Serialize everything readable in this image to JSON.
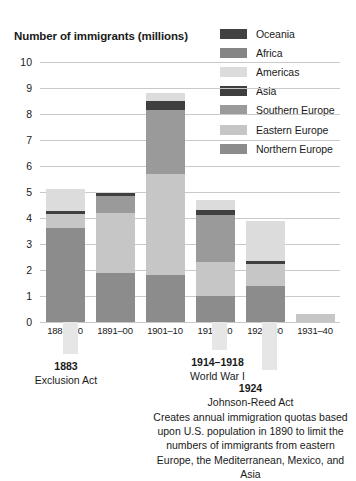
{
  "chart_data": {
    "type": "bar",
    "title": "Number of immigrants (millions)",
    "xlabel": "",
    "ylabel": "Number of immigrants (millions)",
    "ylim": [
      0,
      10
    ],
    "yticks": [
      0,
      1,
      2,
      3,
      4,
      5,
      6,
      7,
      8,
      9,
      10
    ],
    "grid": true,
    "stacked": true,
    "legend_position": "top-right",
    "categories": [
      "1881–90",
      "1891–00",
      "1901–10",
      "1911–20",
      "1921–30",
      "1931–40"
    ],
    "series": [
      {
        "name": "Northern Europe",
        "color": "#8c8c8c",
        "values": [
          3.6,
          1.9,
          1.8,
          1.0,
          1.4,
          0.0
        ]
      },
      {
        "name": "Eastern Europe",
        "color": "#c6c6c6",
        "values": [
          0.55,
          2.3,
          3.9,
          1.3,
          0.85,
          0.3
        ]
      },
      {
        "name": "Southern Europe",
        "color": "#9a9a9a",
        "values": [
          0.0,
          0.65,
          2.45,
          1.8,
          0.0,
          0.0
        ]
      },
      {
        "name": "Asia",
        "color": "#3f3f3f",
        "values": [
          0.12,
          0.1,
          0.35,
          0.2,
          0.1,
          0.0
        ]
      },
      {
        "name": "Americas",
        "color": "#dcdcdc",
        "values": [
          0.83,
          0.05,
          0.3,
          0.4,
          1.55,
          0.0
        ]
      },
      {
        "name": "Africa",
        "color": "#858585",
        "values": [
          0.0,
          0.0,
          0.0,
          0.0,
          0.0,
          0.0
        ]
      },
      {
        "name": "Oceania",
        "color": "#414141",
        "values": [
          0.0,
          0.0,
          0.0,
          0.0,
          0.0,
          0.0
        ]
      }
    ],
    "totals": [
      5.1,
      5.0,
      8.8,
      4.7,
      3.9,
      0.3
    ]
  },
  "legend": {
    "items": [
      {
        "label": "Oceania",
        "color": "#414141"
      },
      {
        "label": "Africa",
        "color": "#858585"
      },
      {
        "label": "Americas",
        "color": "#dcdcdc"
      },
      {
        "label": "Asia",
        "color": "#3f3f3f"
      },
      {
        "label": "Southern  Europe",
        "color": "#9a9a9a"
      },
      {
        "label": "Eastern Europe",
        "color": "#c6c6c6"
      },
      {
        "label": "Northern Europe",
        "color": "#8c8c8c"
      }
    ]
  },
  "annotations": [
    {
      "year": "1883",
      "name": "Exclusion Act",
      "body": ""
    },
    {
      "year": "1914–1918",
      "name": "World  War I",
      "body": ""
    },
    {
      "year": "1924",
      "name": "Johnson-Reed Act",
      "body": "Creates annual immigration quotas based upon U.S. population in 1890 to limit the numbers of immigrants from eastern Europe, the Mediterranean, Mexico, and Asia"
    }
  ]
}
